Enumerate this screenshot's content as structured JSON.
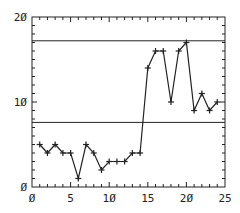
{
  "chart_data": {
    "type": "line",
    "title": "",
    "xlabel": "",
    "ylabel": "",
    "xlim": [
      0,
      25
    ],
    "ylim": [
      0,
      20
    ],
    "x_ticks": [
      "0",
      "5",
      "10",
      "15",
      "20",
      "25"
    ],
    "y_ticks": [
      "0",
      "10",
      "20"
    ],
    "grid": false,
    "legend": null,
    "series": [
      {
        "name": "series",
        "marker": "+",
        "x": [
          1,
          2,
          3,
          4,
          5,
          6,
          7,
          8,
          9,
          10,
          11,
          12,
          13,
          14,
          15,
          16,
          17,
          18,
          19,
          20,
          21,
          22,
          23,
          24
        ],
        "values": [
          5,
          4,
          5,
          4,
          4,
          1,
          5,
          4,
          2,
          3,
          3,
          3,
          4,
          4,
          14,
          16,
          16,
          10,
          16,
          17,
          9,
          11,
          9,
          10
        ]
      }
    ],
    "reference_lines": [
      {
        "orientation": "horizontal",
        "y": 17.2
      },
      {
        "orientation": "horizontal",
        "y": 7.6
      }
    ]
  },
  "axis_labels": {
    "x": [
      "Ø",
      "5",
      "1Ø",
      "15",
      "2Ø",
      "25"
    ],
    "y": [
      "Ø",
      "1Ø",
      "2Ø"
    ]
  },
  "colors": {
    "line": "#222222",
    "axis": "#222222",
    "background": "#ffffff"
  }
}
